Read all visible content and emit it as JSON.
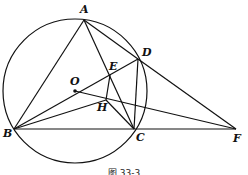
{
  "figure": {
    "caption": "图 33-3",
    "points": {
      "A": {
        "label": "A",
        "x": 84,
        "y": 20
      },
      "B": {
        "label": "B",
        "x": 14,
        "y": 129
      },
      "C": {
        "label": "C",
        "x": 134,
        "y": 129
      },
      "D": {
        "label": "D",
        "x": 138,
        "y": 59
      },
      "E": {
        "label": "E",
        "x": 110,
        "y": 75
      },
      "H": {
        "label": "H",
        "x": 106,
        "y": 100
      },
      "O": {
        "label": "O",
        "x": 75,
        "y": 91
      },
      "F": {
        "label": "F",
        "x": 236,
        "y": 129
      }
    },
    "circle": {
      "center": "O",
      "radius": 72
    },
    "segments": [
      "AB",
      "AC",
      "AD",
      "BD",
      "BH",
      "BF",
      "DC",
      "DF",
      "EH",
      "HC",
      "OF"
    ]
  }
}
